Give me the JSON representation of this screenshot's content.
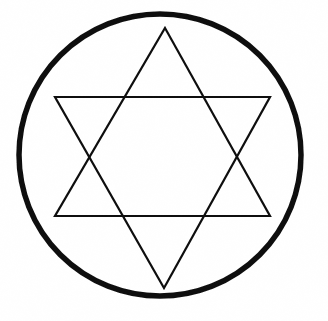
{
  "figure": {
    "background_color": "#ffffff",
    "stroke_color": "#111111",
    "canvas": {
      "width": 328,
      "height": 321
    },
    "circle": {
      "name": "enclosing-circle",
      "center_x": 160,
      "center_y": 155,
      "radius": 141,
      "stroke_width": 5.5,
      "fill": "none"
    },
    "triangle_up": {
      "name": "upward-triangle",
      "points": "165,28 270,216 55,216",
      "stroke_width": 2.2,
      "fill": "none",
      "vertices": [
        {
          "label": "apex",
          "x": 165,
          "y": 28
        },
        {
          "label": "bottom-right",
          "x": 270,
          "y": 216
        },
        {
          "label": "bottom-left",
          "x": 55,
          "y": 216
        }
      ]
    },
    "triangle_down": {
      "name": "downward-triangle",
      "points": "55,97 270,97 164,288",
      "stroke_width": 2.2,
      "fill": "none",
      "vertices": [
        {
          "label": "top-left",
          "x": 55,
          "y": 97
        },
        {
          "label": "top-right",
          "x": 270,
          "y": 97
        },
        {
          "label": "apex",
          "x": 164,
          "y": 288
        }
      ]
    }
  }
}
